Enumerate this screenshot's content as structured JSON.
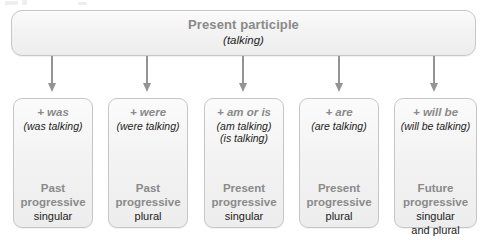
{
  "diagram": {
    "title": "Present participle",
    "subtitle": "(talking)",
    "columns": [
      {
        "aux": "+ was",
        "examples": [
          "(was talking)"
        ],
        "tense": [
          "Past",
          "progressive"
        ],
        "number": [
          "singular"
        ],
        "arrow_x": 52
      },
      {
        "aux": "+ were",
        "examples": [
          "(were talking)"
        ],
        "tense": [
          "Past",
          "progressive"
        ],
        "number": [
          "plural"
        ],
        "arrow_x": 147
      },
      {
        "aux": "+ am or is",
        "examples": [
          "(am talking)",
          "(is talking)"
        ],
        "tense": [
          "Present",
          "progressive"
        ],
        "number": [
          "singular"
        ],
        "arrow_x": 243
      },
      {
        "aux": "+ are",
        "examples": [
          "(are talking)"
        ],
        "tense": [
          "Present",
          "progressive"
        ],
        "number": [
          "plural"
        ],
        "arrow_x": 339
      },
      {
        "aux": "+ will be",
        "examples": [
          "(will be talking)"
        ],
        "tense": [
          "Future",
          "progressive"
        ],
        "number": [
          "singular",
          "and plural"
        ],
        "arrow_x": 434
      }
    ],
    "colors": {
      "heading_text": "#8a8a8a",
      "body_text": "#1c1c1c",
      "box_border": "#c6c6c6",
      "box_fill": "#f3f3f3",
      "arrow": "#949494",
      "background": "#ffffff"
    }
  }
}
